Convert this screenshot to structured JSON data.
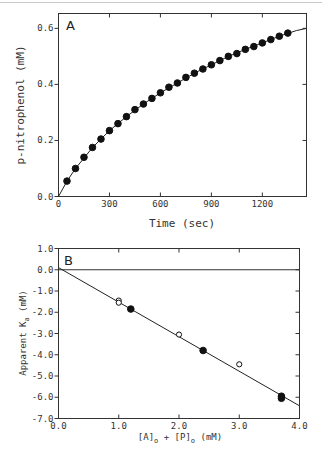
{
  "chart_data": [
    {
      "panel": "A",
      "type": "scatter",
      "title": "",
      "xlabel": "Time (sec)",
      "ylabel": "p-nitrophenol (mM)",
      "xlim": [
        0,
        1460
      ],
      "ylim": [
        0,
        0.653
      ],
      "xticks": [
        0,
        300,
        600,
        900,
        1200
      ],
      "xtick_labels": [
        "0",
        "300",
        "600",
        "900",
        "1200"
      ],
      "yticks": [
        0.0,
        0.2,
        0.4,
        0.6
      ],
      "ytick_labels": [
        "0.0",
        "0.2",
        "0.4",
        "0.6"
      ],
      "grid": false,
      "series": [
        {
          "name": "p-nitrophenol data",
          "marker": "filled-circle",
          "x": [
            50,
            100,
            150,
            200,
            250,
            300,
            350,
            400,
            450,
            500,
            550,
            600,
            650,
            700,
            750,
            800,
            850,
            900,
            950,
            1000,
            1050,
            1100,
            1150,
            1200,
            1250,
            1300,
            1350
          ],
          "y": [
            0.055,
            0.1,
            0.14,
            0.175,
            0.205,
            0.235,
            0.26,
            0.285,
            0.31,
            0.33,
            0.35,
            0.37,
            0.39,
            0.405,
            0.425,
            0.44,
            0.455,
            0.47,
            0.485,
            0.5,
            0.51,
            0.525,
            0.535,
            0.548,
            0.56,
            0.572,
            0.583
          ]
        },
        {
          "name": "fit curve",
          "marker": "line",
          "x": [
            0,
            50,
            100,
            200,
            300,
            400,
            500,
            600,
            700,
            800,
            900,
            1000,
            1100,
            1200,
            1300,
            1400,
            1460
          ],
          "y": [
            0.0,
            0.055,
            0.1,
            0.175,
            0.235,
            0.285,
            0.33,
            0.37,
            0.405,
            0.44,
            0.47,
            0.5,
            0.525,
            0.548,
            0.572,
            0.592,
            0.6
          ]
        }
      ]
    },
    {
      "panel": "B",
      "type": "scatter",
      "title": "",
      "xlabel": "[A]o + [P]o (mM)",
      "ylabel": "Apparent Ka (mM)",
      "xlim": [
        0.0,
        4.0
      ],
      "ylim": [
        -7.0,
        1.0
      ],
      "xticks": [
        0.0,
        1.0,
        2.0,
        3.0,
        4.0
      ],
      "xtick_labels": [
        "0.0",
        "1.0",
        "2.0",
        "3.0",
        "4.0"
      ],
      "yticks": [
        1.0,
        0.0,
        -1.0,
        -2.0,
        -3.0,
        -4.0,
        -5.0,
        -6.0,
        -7.0
      ],
      "ytick_labels": [
        "1.0",
        "0.0",
        "-1.0",
        "-2.0",
        "-3.0",
        "-4.0",
        "-5.0",
        "-6.0",
        "-7.0"
      ],
      "grid": false,
      "hline": 0.0,
      "series": [
        {
          "name": "open circles",
          "marker": "open-circle",
          "x": [
            1.0,
            1.0,
            2.0,
            3.0
          ],
          "y": [
            -1.45,
            -1.55,
            -3.05,
            -4.45
          ]
        },
        {
          "name": "filled circles",
          "marker": "filled-circle",
          "x": [
            1.2,
            2.4,
            3.7,
            3.7
          ],
          "y": [
            -1.85,
            -3.8,
            -5.95,
            -6.05
          ]
        },
        {
          "name": "linear fit",
          "marker": "line",
          "x": [
            0.0,
            4.0
          ],
          "y": [
            0.1,
            -6.4
          ]
        }
      ]
    }
  ],
  "panels": {
    "a": {
      "label": "A",
      "xlabel": "Time (sec)",
      "ylabel": "p-nitrophenol (mM)"
    },
    "b": {
      "label": "B",
      "xlabel_parts": [
        "[A]",
        "o",
        " + [P]",
        "o",
        " (mM)"
      ],
      "ylabel_parts": [
        "Apparent K",
        "a",
        " (mM)"
      ]
    }
  }
}
